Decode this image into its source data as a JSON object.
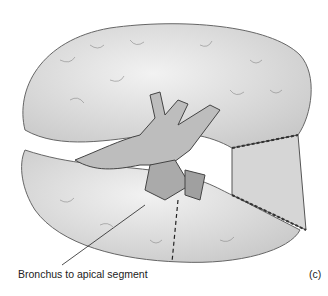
{
  "figure": {
    "annotation_label": "Bronchus to apical segment",
    "panel_label": "(c)",
    "colors": {
      "tissue": "#e4e4e4",
      "outline": "#555555",
      "background": "#ffffff"
    }
  }
}
